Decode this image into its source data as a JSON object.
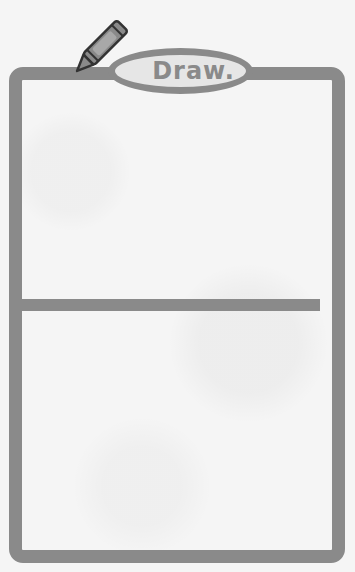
{
  "worksheet": {
    "label": "Draw.",
    "icon": "crayon-icon",
    "panels": 2,
    "colors": {
      "stroke": "#8a8a8a",
      "paper": "#f5f5f5",
      "label_fill": "#e6e6e6"
    }
  }
}
